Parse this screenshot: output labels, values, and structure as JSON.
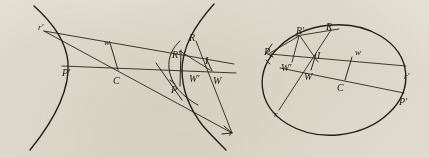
{
  "figure": {
    "background_color": "#efece3",
    "ink_color": "#23221c",
    "width": 429,
    "height": 158,
    "panels": [
      {
        "id": "left-panel",
        "conic_type": "hyperbola",
        "description": "Hyperbola branch opening to the left with transversal chords and labeled points",
        "labels": [
          {
            "name": "label-r-prime-left",
            "text": "r'",
            "x": 38,
            "y": 23,
            "style": "lbl-low"
          },
          {
            "name": "label-w-lower-left",
            "text": "w",
            "x": 104,
            "y": 38,
            "style": "lbl-low"
          },
          {
            "name": "label-P-prime-left",
            "text": "P'",
            "x": 62,
            "y": 68,
            "style": "lbl-cap"
          },
          {
            "name": "label-C-left",
            "text": "C",
            "x": 113,
            "y": 76,
            "style": "lbl-cap"
          },
          {
            "name": "label-R-left",
            "text": "R",
            "x": 189,
            "y": 33,
            "style": "lbl-cap"
          },
          {
            "name": "label-R-prime-left",
            "text": "R'",
            "x": 172,
            "y": 50,
            "style": "lbl-cap"
          },
          {
            "name": "label-I-left",
            "text": "I",
            "x": 205,
            "y": 56,
            "style": "lbl-cap"
          },
          {
            "name": "label-W-prime-left",
            "text": "W'",
            "x": 189,
            "y": 74,
            "style": "lbl-cap"
          },
          {
            "name": "label-W-left",
            "text": "W",
            "x": 213,
            "y": 76,
            "style": "lbl-cap"
          },
          {
            "name": "label-P-left",
            "text": "P",
            "x": 171,
            "y": 85,
            "style": "lbl-cap"
          },
          {
            "name": "label-r-left",
            "text": "r",
            "x": 229,
            "y": 129,
            "style": "lbl-low"
          }
        ]
      },
      {
        "id": "right-panel",
        "conic_type": "ellipse",
        "description": "Ellipse with the same chord construction and labeled points",
        "labels": [
          {
            "name": "label-R-prime-right",
            "text": "R'",
            "x": 296,
            "y": 26,
            "style": "lbl-cap"
          },
          {
            "name": "label-R-right",
            "text": "R",
            "x": 326,
            "y": 22,
            "style": "lbl-cap"
          },
          {
            "name": "label-P-right",
            "text": "P",
            "x": 264,
            "y": 47,
            "style": "lbl-cap"
          },
          {
            "name": "label-I-right",
            "text": "I",
            "x": 317,
            "y": 51,
            "style": "lbl-cap"
          },
          {
            "name": "label-w-right",
            "text": "w",
            "x": 355,
            "y": 48,
            "style": "lbl-low"
          },
          {
            "name": "label-W-prime-right",
            "text": "W'",
            "x": 281,
            "y": 63,
            "style": "lbl-cap"
          },
          {
            "name": "label-W-right",
            "text": "W",
            "x": 304,
            "y": 72,
            "style": "lbl-cap"
          },
          {
            "name": "label-C-right",
            "text": "C",
            "x": 337,
            "y": 83,
            "style": "lbl-cap"
          },
          {
            "name": "label-r-prime-right",
            "text": "r'",
            "x": 404,
            "y": 72,
            "style": "lbl-low"
          },
          {
            "name": "label-P-prime-right",
            "text": "P'",
            "x": 399,
            "y": 97,
            "style": "lbl-cap"
          },
          {
            "name": "label-r-right",
            "text": "r",
            "x": 274,
            "y": 110,
            "style": "lbl-low"
          }
        ]
      }
    ]
  }
}
